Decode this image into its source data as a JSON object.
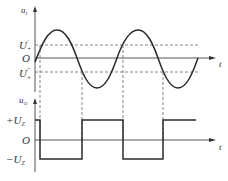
{
  "diagram": {
    "top_plot": {
      "y_axis_label": "u",
      "y_axis_sub": "I",
      "x_axis_label": "t",
      "origin_label": "O",
      "upper_threshold_label": "U",
      "upper_threshold_sup": "'",
      "upper_threshold_sub": "+",
      "lower_threshold_label": "U",
      "lower_threshold_sup": "\"",
      "lower_threshold_sub": "+"
    },
    "bottom_plot": {
      "y_axis_label": "u",
      "y_axis_sub": "O",
      "x_axis_label": "t",
      "origin_label": "O",
      "high_level_label": "+U",
      "high_level_sub": "Z",
      "low_level_label": "−U",
      "low_level_sub": "Z"
    },
    "colors": {
      "curve": "#2a2a2a",
      "axis": "#555555",
      "dashed": "#666666"
    }
  }
}
